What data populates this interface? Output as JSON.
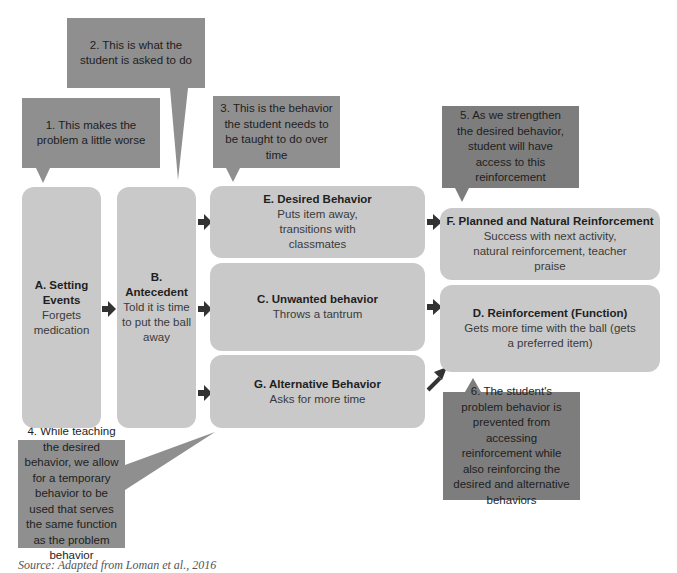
{
  "callouts": {
    "c1": "1. This makes the problem a little worse",
    "c2": "2. This is what the student is asked to do",
    "c3": "3. This is the behavior the student needs to be taught to do over time",
    "c4": "4. While teaching the desired behavior, we allow for a temporary behavior to be used that serves the same function as the problem behavior",
    "c5": "5. As we strengthen the desired behavior, student will have access to this reinforcement",
    "c6": "6. The student's problem behavior is prevented from accessing reinforcement while also reinforcing the desired and alternative behaviors"
  },
  "boxes": {
    "a": {
      "title": "A. Setting Events",
      "text": "Forgets medication"
    },
    "b": {
      "title": "B. Antecedent",
      "text": "Told it is time to put the ball away"
    },
    "e": {
      "title": "E. Desired Behavior",
      "text": "Puts item away, transitions with classmates"
    },
    "c": {
      "title": "C. Unwanted behavior",
      "text": "Throws a tantrum"
    },
    "g": {
      "title": "G. Alternative Behavior",
      "text": "Asks for more time"
    },
    "f": {
      "title": "F. Planned and Natural Reinforcement",
      "text": "Success with next activity, natural reinforcement, teacher praise"
    },
    "d": {
      "title": "D. Reinforcement (Function)",
      "text": "Gets more time with the ball (gets a preferred item)"
    }
  },
  "caption": "Source: Adapted from Loman et al., 2016",
  "colors": {
    "box": "#c9c9c9",
    "callout": "#8f8f8f",
    "callout_dark": "#7d7d7d",
    "arrow": "#333333"
  }
}
